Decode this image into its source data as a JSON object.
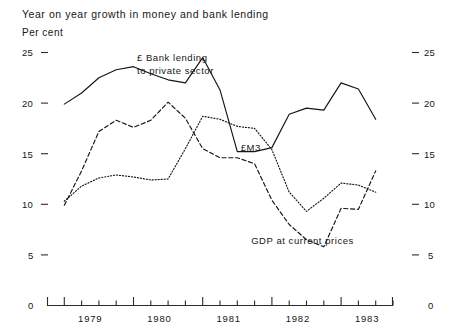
{
  "chart_data": {
    "type": "line",
    "title": "Year on year growth in money and bank lending",
    "subtitle": "Per cent",
    "xlabel": "",
    "ylabel": "Per cent",
    "ylim": [
      0,
      25
    ],
    "xlim": [
      1978.75,
      1983.75
    ],
    "grid": false,
    "legend_position": "inline-annotations",
    "y_ticks": [
      "25",
      "20",
      "15",
      "10",
      "5",
      "0"
    ],
    "y_tick_values": [
      25,
      20,
      15,
      10,
      5,
      0
    ],
    "y_ticks_right": [
      "25",
      "20",
      "15",
      "10",
      "5",
      "0"
    ],
    "x_tick_labels": [
      "1979",
      "1980",
      "1981",
      "1982",
      "1983"
    ],
    "x_tick_values": [
      1979,
      1980,
      1981,
      1982,
      1983
    ],
    "x_minor_ticks_per_year": 4,
    "series": [
      {
        "name": "£ Bank lending to private sector",
        "style": "solid",
        "x": [
          1979.0,
          1979.25,
          1979.5,
          1979.75,
          1980.0,
          1980.25,
          1980.5,
          1980.75,
          1981.0,
          1981.25,
          1981.5,
          1981.75,
          1982.0,
          1982.25,
          1982.5,
          1982.75,
          1983.0,
          1983.25,
          1983.5
        ],
        "values": [
          19.9,
          21.0,
          22.5,
          23.3,
          23.6,
          22.9,
          22.3,
          22.0,
          24.5,
          21.3,
          15.2,
          15.2,
          15.6,
          18.9,
          19.5,
          19.3,
          22.0,
          21.4,
          18.4
        ]
      },
      {
        "name": "GDP at current prices",
        "style": "dashed",
        "x": [
          1979.0,
          1979.25,
          1979.5,
          1979.75,
          1980.0,
          1980.25,
          1980.5,
          1980.75,
          1981.0,
          1981.25,
          1981.5,
          1981.75,
          1982.0,
          1982.25,
          1982.5,
          1982.75,
          1983.0,
          1983.25,
          1983.5
        ],
        "values": [
          9.9,
          13.3,
          17.2,
          18.3,
          17.6,
          18.3,
          20.1,
          18.5,
          15.5,
          14.6,
          14.6,
          14.0,
          10.4,
          8.0,
          6.5,
          5.8,
          9.6,
          9.5,
          13.3
        ]
      },
      {
        "name": "£M3",
        "style": "dotted",
        "x": [
          1979.0,
          1979.25,
          1979.5,
          1979.75,
          1980.0,
          1980.25,
          1980.5,
          1980.75,
          1981.0,
          1981.25,
          1981.5,
          1981.75,
          1982.0,
          1982.25,
          1982.5,
          1982.75,
          1983.0,
          1983.25,
          1983.5
        ],
        "values": [
          10.3,
          11.8,
          12.6,
          12.9,
          12.7,
          12.4,
          12.5,
          15.5,
          18.7,
          18.4,
          17.7,
          17.5,
          15.4,
          11.2,
          9.3,
          10.6,
          12.1,
          11.9,
          11.2
        ]
      }
    ],
    "annotations": [
      {
        "text": "£ Bank lending",
        "x": 1980.05,
        "y": 24.2
      },
      {
        "text": "to private sector",
        "x": 1980.05,
        "y": 22.9
      },
      {
        "text": "£M3",
        "x": 1981.55,
        "y": 15.3
      },
      {
        "text": "GDP at current prices",
        "x": 1981.7,
        "y": 6.1
      }
    ]
  },
  "axis_units": {
    "left": "Per cent",
    "right": ""
  }
}
